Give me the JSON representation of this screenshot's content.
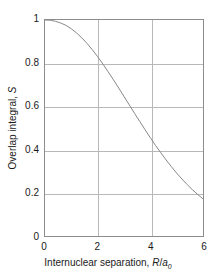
{
  "chart_data": {
    "type": "line",
    "title": "",
    "xlabel": "Internuclear separation, R/a0",
    "ylabel": "Overlap integral, S",
    "xlabel_parts": {
      "text": "Internuclear separation, ",
      "var1": "R",
      "slash": "/",
      "var2": "a",
      "sub": "0"
    },
    "ylabel_parts": {
      "text": "Overlap integral, ",
      "var": "S"
    },
    "xlim": [
      0,
      6
    ],
    "ylim": [
      0,
      1
    ],
    "xticks": [
      0,
      2,
      4,
      6
    ],
    "xtick_labels": [
      "0",
      "2",
      "4",
      "6"
    ],
    "yticks": [
      0,
      0.2,
      0.4,
      0.6,
      0.8,
      1
    ],
    "ytick_labels": [
      "0",
      "0.2",
      "0.4",
      "0.6",
      "0.8",
      "1"
    ],
    "grid": true,
    "grid_x": [
      2,
      4
    ],
    "grid_y": [
      0.2,
      0.4,
      0.6,
      0.8
    ],
    "legend": null,
    "series": [
      {
        "name": "Overlap integral S(R)",
        "x": [
          0.0,
          0.2,
          0.4,
          0.6,
          0.8,
          1.0,
          1.2,
          1.4,
          1.6,
          1.8,
          2.0,
          2.2,
          2.4,
          2.6,
          2.8,
          3.0,
          3.2,
          3.4,
          3.6,
          3.8,
          4.0,
          4.2,
          4.4,
          4.6,
          4.8,
          5.0,
          5.2,
          5.4,
          5.6,
          5.8,
          6.0
        ],
        "y": [
          1.0,
          0.999,
          0.994,
          0.986,
          0.975,
          0.959,
          0.94,
          0.917,
          0.891,
          0.862,
          0.83,
          0.796,
          0.76,
          0.723,
          0.685,
          0.646,
          0.607,
          0.568,
          0.53,
          0.492,
          0.455,
          0.419,
          0.385,
          0.352,
          0.321,
          0.291,
          0.264,
          0.238,
          0.214,
          0.192,
          0.172
        ]
      }
    ],
    "curve_color": "#888888",
    "grid_color": "#b8b8b8",
    "frame_color": "#8c8c8c",
    "text_color": "#1a1a1a",
    "annotation": "S decreases monotonically from 1 at R=0 toward 0 at large R; S=0.6 near R/a0=2 and S=0.2 near R/a0=4"
  }
}
